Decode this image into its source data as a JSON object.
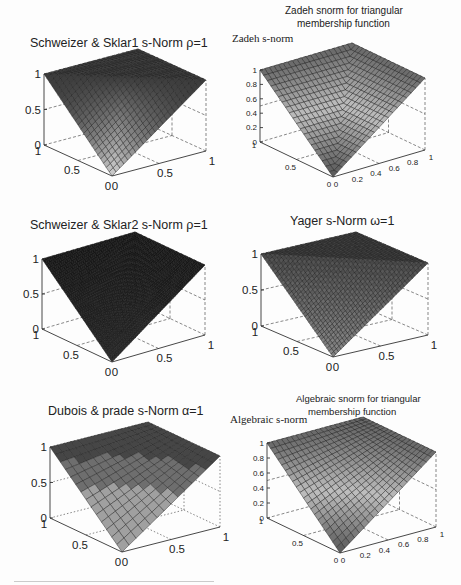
{
  "figure": {
    "caption_fragment": "Fig. 3: Different s-norms (cut off)"
  },
  "chart_data": [
    {
      "id": "p1",
      "type": "surface3d",
      "title": "Schweizer & Sklar1 s-Norm ρ=1",
      "function": "schweizer_sklar1",
      "param": {
        "rho": 1
      },
      "zticks": [
        "0",
        "0.5",
        "1"
      ],
      "xticks": [
        "0",
        "0.5",
        "1"
      ],
      "yticks": [
        "0",
        "0.5",
        "1"
      ],
      "xlim": [
        0,
        1
      ],
      "ylim": [
        0,
        1
      ],
      "zlim": [
        0,
        1
      ],
      "grid": 24,
      "shading": "dark-edges",
      "geom": {
        "zx": 44,
        "ztop": 74,
        "zbot": 145,
        "apex": [
          140,
          50
        ],
        "right": [
          206,
          81
        ],
        "bot": [
          112,
          176
        ],
        "rbot": [
          206,
          151
        ]
      }
    },
    {
      "id": "p2",
      "type": "surface3d",
      "title": "Zadeh snorm for triangular membership function",
      "title_lines": [
        "Zadeh snorm for triangular",
        "membership function"
      ],
      "side_label": "Zadeh s-norm",
      "function": "max_triangular",
      "zticks": [
        "0",
        "0.2",
        "0.4",
        "0.6",
        "0.8",
        "1"
      ],
      "xticks": [
        "0",
        "0.2",
        "0.4",
        "0.6",
        "0.8",
        "1"
      ],
      "yticks": [
        "0",
        "0.5",
        "1"
      ],
      "xlim": [
        0,
        1
      ],
      "ylim": [
        0,
        1
      ],
      "zlim": [
        0,
        1
      ],
      "grid": 20,
      "shading": "light",
      "geom": {
        "zx": 260,
        "ztop": 70,
        "zbot": 142,
        "apex": [
          340,
          42
        ],
        "right": [
          425,
          77
        ],
        "bot": [
          333,
          177
        ],
        "rbot": [
          425,
          150
        ]
      }
    },
    {
      "id": "p3",
      "type": "surface3d",
      "title": "Schweizer & Sklar2 s-Norm ρ=1",
      "function": "schweizer_sklar2",
      "param": {
        "rho": 1
      },
      "zticks": [
        "0",
        "0.5",
        "1"
      ],
      "xticks": [
        "0",
        "0.5",
        "1"
      ],
      "yticks": [
        "0",
        "0.5",
        "1"
      ],
      "xlim": [
        0,
        1
      ],
      "ylim": [
        0,
        1
      ],
      "zlim": [
        0,
        1
      ],
      "grid": 44,
      "shading": "very-dark",
      "geom": {
        "zx": 42,
        "ztop": 259,
        "zbot": 329,
        "apex": [
          130,
          235
        ],
        "right": [
          205,
          266
        ],
        "bot": [
          112,
          362
        ],
        "rbot": [
          205,
          335
        ]
      }
    },
    {
      "id": "p4",
      "type": "surface3d",
      "title": "Yager s-Norm ω=1",
      "function": "yager",
      "param": {
        "omega": 1
      },
      "zticks": [
        "0",
        "0.5",
        "1"
      ],
      "xticks": [
        "0",
        "0.5",
        "1"
      ],
      "yticks": [
        "0",
        "0.5",
        "1"
      ],
      "xlim": [
        0,
        1
      ],
      "ylim": [
        0,
        1
      ],
      "zlim": [
        0,
        1
      ],
      "grid": 36,
      "shading": "mid",
      "geom": {
        "zx": 261,
        "ztop": 254,
        "zbot": 326,
        "apex": [
          352,
          233
        ],
        "right": [
          428,
          262
        ],
        "bot": [
          333,
          357
        ],
        "rbot": [
          428,
          335
        ]
      }
    },
    {
      "id": "p5",
      "type": "surface3d",
      "title": "Dubois & prade s-Norm α=1",
      "function": "dubois_prade",
      "param": {
        "alpha": 1
      },
      "zticks": [
        "0",
        "0.5",
        "1"
      ],
      "xticks": [
        "0",
        "0.5",
        "1"
      ],
      "yticks": [
        "0",
        "0.5",
        "1"
      ],
      "xlim": [
        0,
        1
      ],
      "ylim": [
        0,
        1
      ],
      "zlim": [
        0,
        1
      ],
      "grid": 14,
      "shading": "banded",
      "grid_style": "dotted",
      "geom": {
        "zx": 50,
        "ztop": 447,
        "zbot": 518,
        "apex": [
          140,
          420
        ],
        "right": [
          220,
          455
        ],
        "bot": [
          122,
          552
        ],
        "rbot": [
          220,
          527
        ]
      }
    },
    {
      "id": "p6",
      "type": "surface3d",
      "title": "Algebraic snorm for triangular membership function",
      "title_lines": [
        "Algebraic snorm for triangular",
        "membership function"
      ],
      "side_label": "Algebraic s-norm",
      "function": "algebraic_triangular",
      "zticks": [
        "0",
        "0.2",
        "0.4",
        "0.6",
        "0.8",
        "1"
      ],
      "xticks": [
        "0",
        "0.2",
        "0.4",
        "0.6",
        "0.8",
        "1"
      ],
      "yticks": [
        "0",
        "0.5",
        "1"
      ],
      "xlim": [
        0,
        1
      ],
      "ylim": [
        0,
        1
      ],
      "zlim": [
        0,
        1
      ],
      "grid": 20,
      "shading": "light",
      "geom": {
        "zx": 267,
        "ztop": 443,
        "zbot": 518,
        "apex": [
          350,
          418
        ],
        "right": [
          436,
          452
        ],
        "bot": [
          340,
          553
        ],
        "rbot": [
          436,
          527
        ]
      }
    }
  ],
  "layout": {
    "titles": [
      {
        "id": "p1",
        "x": 30,
        "y": 36,
        "size": 12.5
      },
      {
        "id": "p2",
        "x": 285,
        "y": 5,
        "size": 10,
        "side_x": 232,
        "side_y": 32,
        "side_size": 11
      },
      {
        "id": "p3",
        "x": 30,
        "y": 218,
        "size": 12.5
      },
      {
        "id": "p4",
        "x": 290,
        "y": 214,
        "size": 12.5
      },
      {
        "id": "p5",
        "x": 48,
        "y": 404,
        "size": 12.5
      },
      {
        "id": "p6",
        "x": 296,
        "y": 393,
        "size": 9.5,
        "side_x": 230,
        "side_y": 413,
        "side_size": 11
      }
    ]
  }
}
